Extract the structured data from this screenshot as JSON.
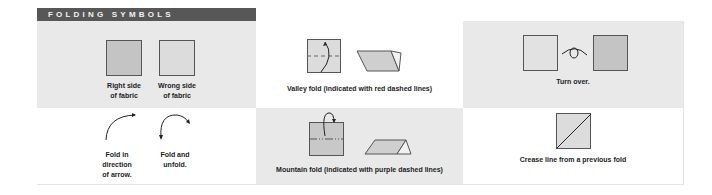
{
  "header": {
    "title": "FOLDING SYMBOLS"
  },
  "colors": {
    "header_bg": "#575757",
    "cell_gray": "#e9e9e9",
    "cell_white": "#ffffff",
    "right_side_fill": "#c4c4c4",
    "wrong_side_fill": "#dcdcdc",
    "valley_line": "#d9534f",
    "mountain_line": "#7a4a8a"
  },
  "symbols": [
    {
      "id": "right-side",
      "label_lines": [
        "Right side",
        "of fabric"
      ],
      "icon": "filled-square-icon"
    },
    {
      "id": "wrong-side",
      "label_lines": [
        "Wrong side",
        "of fabric"
      ],
      "icon": "light-square-icon"
    },
    {
      "id": "valley-fold",
      "label": "Valley fold (indicated with red dashed lines)",
      "icon": "valley-fold-icon"
    },
    {
      "id": "turn-over",
      "label": "Turn over.",
      "icon": "turn-over-icon"
    },
    {
      "id": "fold-direction",
      "label_lines": [
        "Fold in",
        "direction",
        "of arrow."
      ],
      "icon": "curved-arrow-icon"
    },
    {
      "id": "fold-unfold",
      "label_lines": [
        "Fold and",
        "unfold."
      ],
      "icon": "fold-unfold-arrow-icon"
    },
    {
      "id": "mountain-fold",
      "label": "Mountain fold (indicated with purple dashed lines)",
      "icon": "mountain-fold-icon"
    },
    {
      "id": "crease-line",
      "label": "Crease line from a previous fold",
      "icon": "crease-line-icon"
    }
  ]
}
